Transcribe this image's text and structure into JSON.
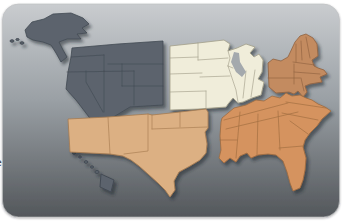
{
  "card": {
    "bg_top": "#c9cccf",
    "bg_mid": "#9aa0a5",
    "bg_bottom": "#53575b",
    "edge": "#bdbfc1",
    "outer_background": "#ffffff"
  },
  "map": {
    "lake_color": "#a4a9ad",
    "shadow_color": "#24282d",
    "regions": {
      "west": {
        "color": "#5b636d",
        "border": "#434a53"
      },
      "midwest": {
        "color": "#f0edda",
        "border": "#a29e89"
      },
      "northeast": {
        "color": "#c38b60",
        "border": "#8f6240"
      },
      "southeast": {
        "color": "#d5935f",
        "border": "#9e6b3f"
      },
      "southwest": {
        "color": "#dcb083",
        "border": "#a67b50"
      }
    }
  },
  "edge_fragment": {
    "text": "e"
  }
}
